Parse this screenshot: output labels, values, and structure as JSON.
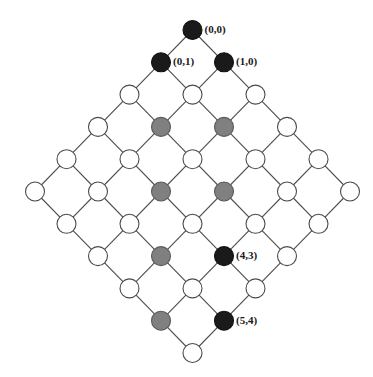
{
  "diagram": {
    "type": "node-link-lattice",
    "canvas": {
      "width": 373,
      "height": 377,
      "background": "#ffffff"
    },
    "geometry": {
      "center_x": 192.5,
      "top_y": 30,
      "half_step_x": 31.5,
      "row_step_y": 32.3,
      "node_radius": 9.5,
      "rows": 11,
      "row_sizes": [
        1,
        2,
        3,
        4,
        5,
        6,
        5,
        4,
        3,
        2,
        1
      ]
    },
    "colors": {
      "black": "#1a1a1a",
      "gray": "#808080",
      "white": "#ffffff",
      "edge": "#4a4a4a",
      "label": "#1a1a1a"
    },
    "legend_note": "black = marked path endpoints, gray = intermediate chain, white = plain node",
    "nodes": [
      {
        "row": 0,
        "col": 0,
        "fill": "black",
        "label": "(0,0)"
      },
      {
        "row": 1,
        "col": 0,
        "fill": "black",
        "label": "(0,1)"
      },
      {
        "row": 1,
        "col": 1,
        "fill": "black",
        "label": "(1,0)"
      },
      {
        "row": 2,
        "col": 0,
        "fill": "white",
        "label": ""
      },
      {
        "row": 2,
        "col": 1,
        "fill": "white",
        "label": ""
      },
      {
        "row": 2,
        "col": 2,
        "fill": "white",
        "label": ""
      },
      {
        "row": 3,
        "col": 0,
        "fill": "white",
        "label": ""
      },
      {
        "row": 3,
        "col": 1,
        "fill": "gray",
        "label": ""
      },
      {
        "row": 3,
        "col": 2,
        "fill": "gray",
        "label": ""
      },
      {
        "row": 3,
        "col": 3,
        "fill": "white",
        "label": ""
      },
      {
        "row": 4,
        "col": 0,
        "fill": "white",
        "label": ""
      },
      {
        "row": 4,
        "col": 1,
        "fill": "white",
        "label": ""
      },
      {
        "row": 4,
        "col": 2,
        "fill": "white",
        "label": ""
      },
      {
        "row": 4,
        "col": 3,
        "fill": "white",
        "label": ""
      },
      {
        "row": 4,
        "col": 4,
        "fill": "white",
        "label": ""
      },
      {
        "row": 5,
        "col": 0,
        "fill": "white",
        "label": ""
      },
      {
        "row": 5,
        "col": 1,
        "fill": "white",
        "label": ""
      },
      {
        "row": 5,
        "col": 2,
        "fill": "gray",
        "label": ""
      },
      {
        "row": 5,
        "col": 3,
        "fill": "gray",
        "label": ""
      },
      {
        "row": 5,
        "col": 4,
        "fill": "white",
        "label": ""
      },
      {
        "row": 5,
        "col": 5,
        "fill": "white",
        "label": ""
      },
      {
        "row": 6,
        "col": 0,
        "fill": "white",
        "label": ""
      },
      {
        "row": 6,
        "col": 1,
        "fill": "white",
        "label": ""
      },
      {
        "row": 6,
        "col": 2,
        "fill": "white",
        "label": ""
      },
      {
        "row": 6,
        "col": 3,
        "fill": "white",
        "label": ""
      },
      {
        "row": 6,
        "col": 4,
        "fill": "white",
        "label": ""
      },
      {
        "row": 7,
        "col": 0,
        "fill": "white",
        "label": ""
      },
      {
        "row": 7,
        "col": 1,
        "fill": "gray",
        "label": ""
      },
      {
        "row": 7,
        "col": 2,
        "fill": "black",
        "label": "(4,3)"
      },
      {
        "row": 7,
        "col": 3,
        "fill": "white",
        "label": ""
      },
      {
        "row": 8,
        "col": 0,
        "fill": "white",
        "label": ""
      },
      {
        "row": 8,
        "col": 1,
        "fill": "white",
        "label": ""
      },
      {
        "row": 8,
        "col": 2,
        "fill": "white",
        "label": ""
      },
      {
        "row": 9,
        "col": 0,
        "fill": "gray",
        "label": ""
      },
      {
        "row": 9,
        "col": 1,
        "fill": "black",
        "label": "(5,4)"
      },
      {
        "row": 10,
        "col": 0,
        "fill": "white",
        "label": ""
      }
    ]
  }
}
